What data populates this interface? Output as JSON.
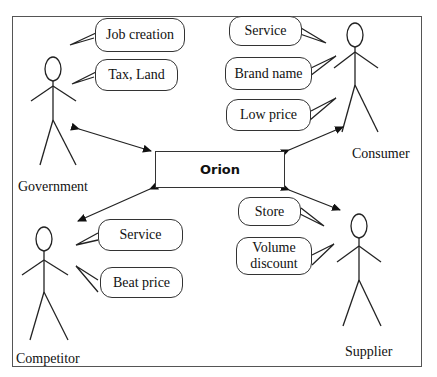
{
  "diagram": {
    "center": {
      "label": "Orion"
    },
    "actors": [
      {
        "name": "Government",
        "bubbles": [
          "Job creation",
          "Tax, Land"
        ]
      },
      {
        "name": "Consumer",
        "bubbles": [
          "Service",
          "Brand name",
          "Low price"
        ]
      },
      {
        "name": "Competitor",
        "bubbles": [
          "Service",
          "Beat price"
        ]
      },
      {
        "name": "Supplier",
        "bubbles": [
          "Store",
          "Volume",
          "discount"
        ]
      }
    ]
  }
}
